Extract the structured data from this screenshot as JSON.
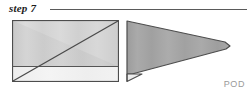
{
  "header": {
    "step_label": "step 7",
    "rule": "horizontal-rule"
  },
  "watermark": {
    "text": "POD"
  },
  "figures": [
    {
      "id": "figure-before",
      "name": "folded-paper-before",
      "description": "rectangle with diagonal fold line and bottom flap strip",
      "width": 107,
      "height": 62
    },
    {
      "id": "figure-after",
      "name": "folded-paper-after",
      "description": "wedge shape resulting from the fold, pointed at right",
      "width": 107,
      "height": 62
    }
  ],
  "colors": {
    "outline": "#4d4d4d",
    "paper_light": "#d6d6d6",
    "paper_mid": "#b4b4b4",
    "paper_dark": "#a2a2a2",
    "flap_white": "#f2f2f2",
    "header_rule": "#5a5a5a",
    "text": "#1c1c1c",
    "watermark": "#9a9a9a",
    "background": "#ffffff"
  }
}
